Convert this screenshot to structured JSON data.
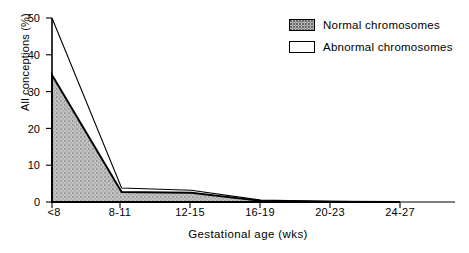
{
  "chart_data": {
    "type": "area",
    "title": "",
    "xlabel": "Gestational age (wks)",
    "ylabel": "All conceptions (%)",
    "categories": [
      "<8",
      "8-11",
      "12-15",
      "16-19",
      "20-23",
      "24-27"
    ],
    "ylim": [
      0,
      50
    ],
    "xlim_categories": 6,
    "yticks": [
      0,
      10,
      20,
      30,
      40,
      50
    ],
    "ytick_labels": [
      "0",
      "10",
      "20",
      "30",
      "40",
      "50"
    ],
    "grid": false,
    "stacked": true,
    "legend_position": "top-right",
    "series": [
      {
        "name": "Normal chromosomes",
        "fill": "stipple-gray",
        "values": [
          34.5,
          2.7,
          2.5,
          0.3,
          0.1,
          0.0
        ]
      },
      {
        "name": "Abnormal chromosomes",
        "fill": "white",
        "values": [
          15.5,
          1.1,
          0.7,
          0.2,
          0.1,
          0.0
        ]
      }
    ],
    "cumulative_totals": [
      50.0,
      3.8,
      3.2,
      0.5,
      0.2,
      0.0
    ]
  },
  "axes": {
    "y_title": "All conceptions (%)",
    "x_title": "Gestational age (wks)",
    "y_tick_labels": [
      "50",
      "40",
      "30",
      "20",
      "10",
      "0"
    ],
    "x_tick_labels": [
      "<8",
      "8-11",
      "12-15",
      "16-19",
      "20-23",
      "24-27"
    ]
  },
  "legend": {
    "items": [
      {
        "label": "Normal chromosomes",
        "swatch": "stippled-gray-box"
      },
      {
        "label": "Abnormal chromosomes",
        "swatch": "white-box"
      }
    ]
  },
  "colors": {
    "axis": "#000000",
    "normal_fill": "#b8b8b8",
    "normal_stipple": "#6a6a6a",
    "abnormal_fill": "#ffffff",
    "line": "#000000"
  }
}
